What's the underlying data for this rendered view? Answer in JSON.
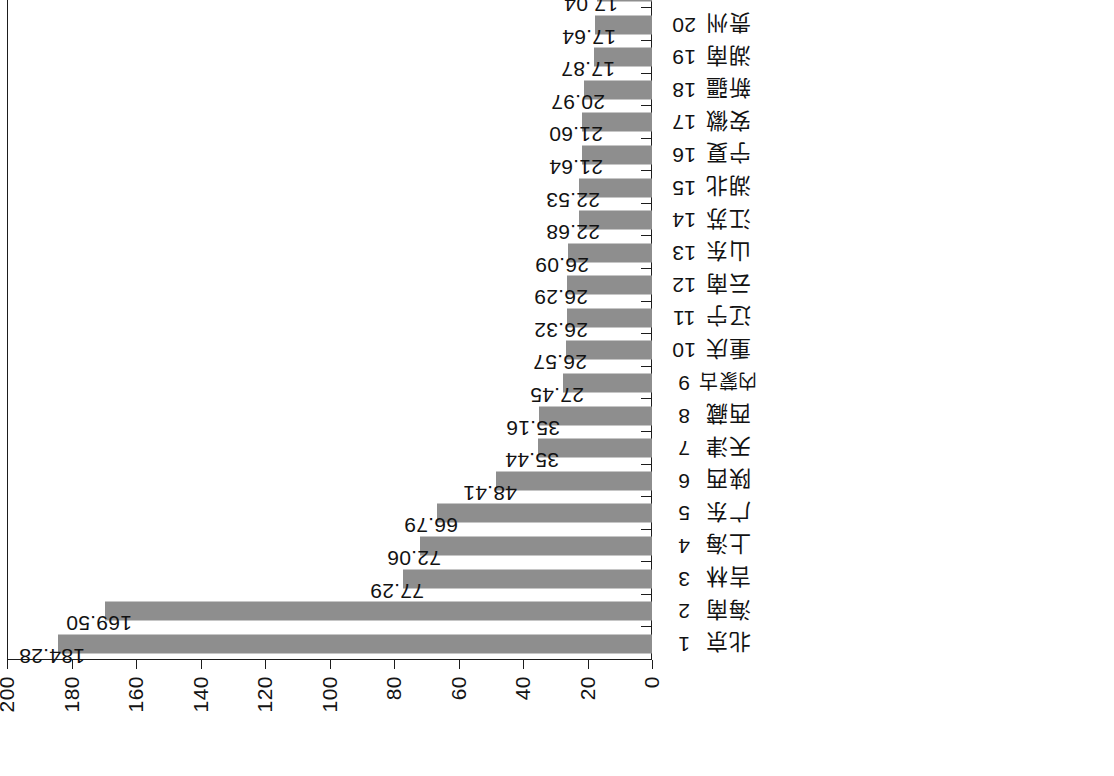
{
  "chart_data": {
    "type": "bar",
    "title": "",
    "subtitle": "",
    "xlabel": "",
    "ylabel": "",
    "orientation": "vertical-rotated-90",
    "grid": false,
    "legend": null,
    "bar_color": "#8e8e8e",
    "axis_color": "#1d1d1d",
    "ylim": [
      0,
      200
    ],
    "yticks": [
      0,
      20,
      40,
      60,
      80,
      100,
      120,
      140,
      160,
      180,
      200
    ],
    "ytick_labels": [
      "0",
      "20",
      "40",
      "60",
      "80",
      "100",
      "120",
      "140",
      "160",
      "180",
      "200"
    ],
    "value_label_format": "2-decimal",
    "categories": [
      "北京",
      "海南",
      "吉林",
      "上海",
      "广东",
      "陕西",
      "天津",
      "西藏",
      "内蒙古",
      "重庆",
      "辽宁",
      "云南",
      "山东",
      "江苏",
      "湖北",
      "宁夏",
      "安徽",
      "新疆",
      "湖南",
      "贵州",
      "四川",
      "河北",
      "浙江",
      "黑龙江",
      "甘肃",
      "山西",
      "广西",
      "青海",
      "河南",
      "江西",
      "福建"
    ],
    "index_labels": [
      "1",
      "2",
      "3",
      "4",
      "5",
      "6",
      "7",
      "8",
      "9",
      "10",
      "11",
      "12",
      "13",
      "14",
      "15",
      "16",
      "17",
      "18",
      "19",
      "20",
      "21",
      "22",
      "23",
      "24",
      "25",
      "26",
      "27",
      "28",
      "29",
      "30",
      "31"
    ],
    "values": [
      184.28,
      169.5,
      77.29,
      72.06,
      66.79,
      48.41,
      35.44,
      35.16,
      27.45,
      26.57,
      26.32,
      26.29,
      26.09,
      22.68,
      22.53,
      21.64,
      21.6,
      20.97,
      17.87,
      17.64,
      17.04,
      16.98,
      14.34,
      13.12,
      13.01,
      11.86,
      10.28,
      10.14,
      9.93,
      9.4,
      8.8
    ],
    "value_labels": [
      "184.28",
      "169.50",
      "77.29",
      "72.06",
      "66.79",
      "48.41",
      "35.44",
      "35.16",
      "27.45",
      "26.57",
      "26.32",
      "26.29",
      "26.09",
      "22.68",
      "22.53",
      "21.64",
      "21.60",
      "20.97",
      "17.87",
      "17.64",
      "17.04",
      "16.98",
      "14.34",
      "13.12",
      "13.01",
      "11.86",
      "10.28",
      "10.14",
      "9.93",
      "9.40",
      "8.80"
    ]
  }
}
